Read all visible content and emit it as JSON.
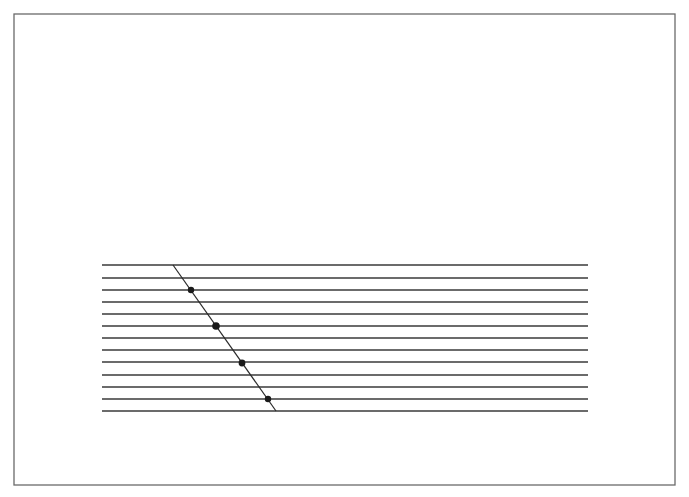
{
  "figure": {
    "frame": {
      "x": 14,
      "y": 14,
      "width": 661,
      "height": 471,
      "stroke": "#6a6a6a"
    },
    "parallel_lines": {
      "count": 13,
      "x_start": 102,
      "x_end": 588,
      "y_positions": [
        265,
        278,
        290,
        302,
        314,
        326,
        338,
        350,
        362,
        375,
        387,
        399,
        411
      ],
      "stroke": "#3a3a3a"
    },
    "transversal": {
      "x1": 173,
      "y1": 265,
      "x2": 276,
      "y2": 411,
      "stroke": "#2a2a2a"
    },
    "points": [
      {
        "x": 191,
        "y": 290,
        "r": 3.2
      },
      {
        "x": 216,
        "y": 326,
        "r": 3.8
      },
      {
        "x": 242,
        "y": 363,
        "r": 3.4
      },
      {
        "x": 268,
        "y": 399,
        "r": 3.2
      }
    ],
    "point_color": "#1a1a1a"
  }
}
